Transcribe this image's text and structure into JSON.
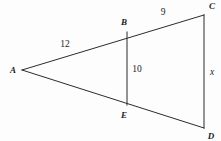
{
  "figure": {
    "type": "geometry-diagram",
    "background_color": "#fdfdfd",
    "line_color": "#2b2b2b",
    "text_color": "#1c1c1c",
    "width": 221,
    "height": 141,
    "vertices": [
      {
        "name": "A",
        "label": "A",
        "point_x": 22,
        "point_y": 70,
        "label_x": 13,
        "label_y": 70
      },
      {
        "name": "B",
        "label": "B",
        "point_x": 127,
        "point_y": 32,
        "label_x": 124,
        "label_y": 22
      },
      {
        "name": "C",
        "label": "C",
        "point_x": 204,
        "point_y": 15,
        "label_x": 212,
        "label_y": 6
      },
      {
        "name": "D",
        "label": "D",
        "point_x": 204,
        "point_y": 128,
        "label_x": 211,
        "label_y": 136
      },
      {
        "name": "E",
        "label": "E",
        "point_x": 127,
        "point_y": 105,
        "label_x": 124,
        "label_y": 115
      }
    ],
    "segments": [
      {
        "name": "segment-AC",
        "from": "A",
        "to": "C",
        "x1": 22,
        "y1": 70,
        "x2": 204,
        "y2": 15
      },
      {
        "name": "segment-AD",
        "from": "A",
        "to": "D",
        "x1": 22,
        "y1": 70,
        "x2": 204,
        "y2": 128
      },
      {
        "name": "segment-CD",
        "from": "C",
        "to": "D",
        "x1": 204,
        "y1": 15,
        "x2": 204,
        "y2": 128
      },
      {
        "name": "segment-BE",
        "from": "B",
        "to": "E",
        "x1": 127,
        "y1": 32,
        "x2": 127,
        "y2": 105
      }
    ],
    "measures": [
      {
        "name": "measure-AB",
        "segment": "AB",
        "text": "12",
        "numeric": true,
        "x": 65,
        "y": 45
      },
      {
        "name": "measure-BC",
        "segment": "BC",
        "text": "9",
        "numeric": true,
        "x": 163,
        "y": 13
      },
      {
        "name": "measure-BE",
        "segment": "BE",
        "text": "10",
        "numeric": true,
        "x": 137,
        "y": 70
      },
      {
        "name": "measure-CD",
        "segment": "CD",
        "text": "x",
        "numeric": false,
        "x": 212,
        "y": 73
      }
    ]
  }
}
